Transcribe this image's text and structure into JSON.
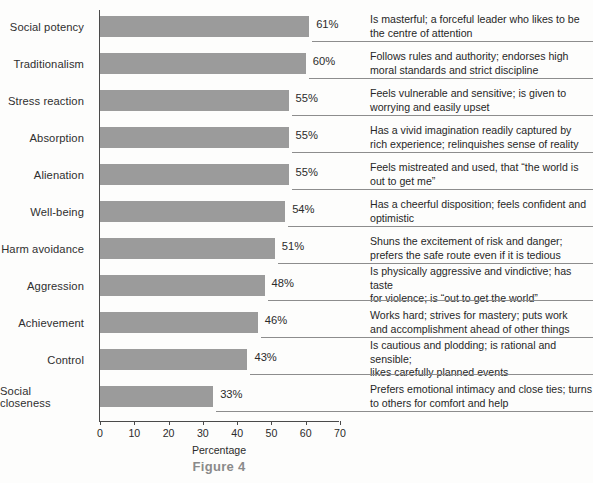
{
  "figure": {
    "caption": "Figure 4",
    "axis_title": "Percentage"
  },
  "chart_data": {
    "type": "bar",
    "orientation": "horizontal",
    "title": "Figure 4",
    "xlabel": "Percentage",
    "ylabel": "",
    "xlim": [
      0,
      70
    ],
    "xticks": [
      "0",
      "10",
      "20",
      "30",
      "40",
      "50",
      "60",
      "70"
    ],
    "grid": false,
    "legend": null,
    "bar_color": "#9b9b9b",
    "categories": [
      "Social potency",
      "Traditionalism",
      "Stress reaction",
      "Absorption",
      "Alienation",
      "Well-being",
      "Harm avoidance",
      "Aggression",
      "Achievement",
      "Control",
      "Social closeness"
    ],
    "values": [
      61,
      60,
      55,
      55,
      55,
      54,
      51,
      48,
      46,
      43,
      33
    ],
    "value_labels": [
      "61%",
      "60%",
      "55%",
      "55%",
      "55%",
      "54%",
      "51%",
      "48%",
      "46%",
      "43%",
      "33%"
    ],
    "annotations": [
      [
        "Is masterful; a forceful leader who likes to be",
        "the centre of attention"
      ],
      [
        "Follows rules and authority; endorses high",
        "moral standards and strict discipline"
      ],
      [
        "Feels vulnerable and sensitive; is given to",
        "worrying and easily upset"
      ],
      [
        "Has a vivid imagination readily captured by",
        "rich experience; relinquishes sense of reality"
      ],
      [
        "Feels mistreated and used, that “the world is",
        "out to get me”"
      ],
      [
        "Has a cheerful disposition; feels confident and",
        "optimistic"
      ],
      [
        "Shuns the excitement of risk and danger;",
        "prefers the safe route even if it is tedious"
      ],
      [
        "Is physically aggressive and vindictive; has taste",
        "for violence; is “out to get the world”"
      ],
      [
        "Works hard; strives for mastery; puts work",
        "and accomplishment ahead of other things"
      ],
      [
        "Is cautious and plodding; is rational and sensible;",
        "likes carefully planned events"
      ],
      [
        "Prefers emotional intimacy and close ties; turns",
        "to others for comfort and help"
      ]
    ]
  }
}
